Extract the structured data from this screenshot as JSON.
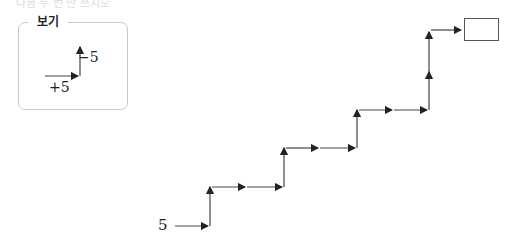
{
  "header": {
    "text": "다음 두 번 만 쓰시오"
  },
  "legend": {
    "title": "보기",
    "up_label": "−5",
    "right_label": "+5"
  },
  "diagram": {
    "start_value": "5",
    "target_value": "",
    "steps": [
      "right",
      "up",
      "right",
      "right",
      "up",
      "right",
      "right",
      "up",
      "right",
      "right",
      "up",
      "up",
      "right"
    ],
    "stroke_color": "#333333"
  }
}
